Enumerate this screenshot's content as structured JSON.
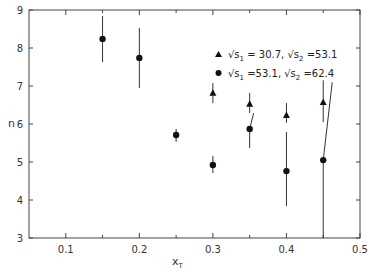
{
  "chart_data": {
    "type": "scatter",
    "title": "",
    "xlabel": "x_T",
    "ylabel": "n",
    "xlim": [
      0.05,
      0.5
    ],
    "ylim": [
      3,
      9
    ],
    "xticks": [
      "0.1",
      "0.2",
      "0.3",
      "0.4",
      "0.5"
    ],
    "yticks": [
      "3",
      "4",
      "5",
      "6",
      "7",
      "8",
      "9"
    ],
    "grid": false,
    "legend_position": "upper right (inside)",
    "series": [
      {
        "name": "√s1 = 30.7, √s2 = 53.1",
        "marker": "triangle",
        "points": [
          {
            "x": 0.3,
            "y": 6.82,
            "ylow": 6.55,
            "yhigh": 7.08
          },
          {
            "x": 0.35,
            "y": 6.53,
            "ylow": 6.29,
            "yhigh": 6.82
          },
          {
            "x": 0.4,
            "y": 6.24,
            "ylow": 6.03,
            "yhigh": 6.55
          },
          {
            "x": 0.45,
            "y": 6.58,
            "ylow": 6.05,
            "yhigh": 7.15
          }
        ]
      },
      {
        "name": "√s1 = 53.1, √s2 = 62.4",
        "marker": "circle",
        "points": [
          {
            "x": 0.15,
            "y": 8.24,
            "ylow": 7.63,
            "yhigh": 8.84
          },
          {
            "x": 0.2,
            "y": 7.74,
            "ylow": 6.95,
            "yhigh": 8.53
          },
          {
            "x": 0.25,
            "y": 5.71,
            "ylow": 5.53,
            "yhigh": 5.87
          },
          {
            "x": 0.3,
            "y": 4.92,
            "ylow": 4.71,
            "yhigh": 5.16
          },
          {
            "x": 0.35,
            "y": 5.87,
            "ylow": 5.37,
            "yhigh": 6.29
          },
          {
            "x": 0.4,
            "y": 4.76,
            "ylow": 3.84,
            "yhigh": 5.79
          },
          {
            "x": 0.45,
            "y": 5.05,
            "ylow": 3.0,
            "yhigh": 7.1
          }
        ]
      }
    ]
  },
  "legend": {
    "row1": {
      "sqrt": "√s",
      "sub1": "1",
      "val1": " = 30.7, ",
      "sub2": "2",
      "val2": " =53.1"
    },
    "row2": {
      "sqrt": "√s",
      "sub1": "1",
      "val1": " =53.1, ",
      "sub2": "2",
      "val2": " =62.4"
    }
  },
  "axes": {
    "xlabel_main": "x",
    "xlabel_sub": "T",
    "ylabel": "n"
  }
}
